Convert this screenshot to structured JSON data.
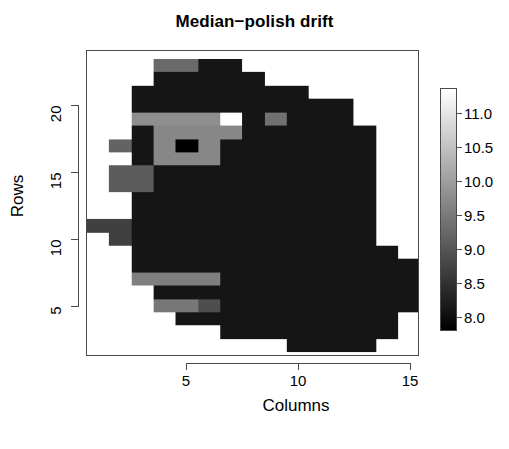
{
  "title": "Median−polish drift",
  "axes": {
    "x_label": "Columns",
    "y_label": "Rows",
    "x_ticks": [
      "5",
      "10",
      "15"
    ],
    "y_ticks": [
      "5",
      "10",
      "15",
      "20"
    ]
  },
  "colorbar": {
    "ticks": [
      "11.0",
      "10.5",
      "10.0",
      "9.5",
      "9.0",
      "8.5",
      "8.0"
    ],
    "low_color": "#000000",
    "high_color": "#ffffff"
  },
  "chart_data": {
    "type": "heatmap",
    "title": "Median−polish drift",
    "xlabel": "Columns",
    "ylabel": "Rows",
    "xlim": [
      0.5,
      15.4
    ],
    "ylim": [
      1.3,
      24.1
    ],
    "grid": false,
    "legend_position": "right",
    "colormap": "grayscale",
    "zlim": [
      7.7,
      11.3
    ],
    "colorbar_ticks": [
      8.0,
      8.5,
      9.0,
      9.5,
      10.0,
      10.5,
      11.0
    ],
    "x": [
      1,
      2,
      3,
      4,
      5,
      6,
      7,
      8,
      9,
      10,
      11,
      12,
      13,
      14,
      15
    ],
    "y": [
      2,
      3,
      4,
      5,
      6,
      7,
      8,
      9,
      10,
      11,
      12,
      13,
      14,
      15,
      16,
      17,
      18,
      19,
      20,
      21,
      22,
      23
    ],
    "z_note": "NA cells rendered white (no data); numeric cells are drift values in 7.7-11.3",
    "z": [
      [
        null,
        null,
        null,
        null,
        null,
        null,
        null,
        null,
        null,
        8.0,
        8.0,
        8.0,
        8.0,
        null,
        null
      ],
      [
        null,
        null,
        null,
        null,
        null,
        null,
        8.0,
        8.0,
        8.0,
        8.0,
        8.0,
        8.0,
        8.0,
        8.0,
        null
      ],
      [
        null,
        null,
        null,
        null,
        8.0,
        8.0,
        8.0,
        8.0,
        8.0,
        8.0,
        8.0,
        8.0,
        8.0,
        8.0,
        null
      ],
      [
        null,
        null,
        null,
        9.4,
        9.4,
        8.8,
        8.0,
        8.0,
        8.0,
        8.0,
        8.0,
        8.0,
        8.0,
        8.0,
        8.0
      ],
      [
        null,
        null,
        null,
        8.0,
        8.0,
        8.0,
        8.0,
        8.0,
        8.0,
        8.0,
        8.0,
        8.0,
        8.0,
        8.0,
        8.0
      ],
      [
        null,
        null,
        9.5,
        9.5,
        9.5,
        9.5,
        8.0,
        8.0,
        8.0,
        8.0,
        8.0,
        8.0,
        8.0,
        8.0,
        8.0
      ],
      [
        null,
        null,
        8.0,
        8.0,
        8.0,
        8.0,
        8.0,
        8.0,
        8.0,
        8.0,
        8.0,
        8.0,
        8.0,
        8.0,
        8.0
      ],
      [
        null,
        null,
        8.0,
        8.0,
        8.0,
        8.0,
        8.0,
        8.0,
        8.0,
        8.0,
        8.0,
        8.0,
        8.0,
        8.0,
        null
      ],
      [
        null,
        8.6,
        8.0,
        8.0,
        8.0,
        8.0,
        8.0,
        8.0,
        8.0,
        8.0,
        8.0,
        8.0,
        8.0,
        null,
        null
      ],
      [
        8.6,
        8.6,
        8.0,
        8.0,
        8.0,
        8.0,
        8.0,
        8.0,
        8.0,
        8.0,
        8.0,
        8.0,
        8.0,
        null,
        null
      ],
      [
        null,
        null,
        8.0,
        8.0,
        8.0,
        8.0,
        8.0,
        8.0,
        8.0,
        8.0,
        8.0,
        8.0,
        8.0,
        null,
        null
      ],
      [
        null,
        null,
        8.0,
        8.0,
        8.0,
        8.0,
        8.0,
        8.0,
        8.0,
        8.0,
        8.0,
        8.0,
        8.0,
        null,
        null
      ],
      [
        null,
        9.0,
        9.0,
        8.0,
        8.0,
        8.0,
        8.0,
        8.0,
        8.0,
        8.0,
        8.0,
        8.0,
        8.0,
        null,
        null
      ],
      [
        null,
        9.0,
        9.0,
        8.0,
        8.0,
        8.0,
        8.0,
        8.0,
        8.0,
        8.0,
        8.0,
        8.0,
        8.0,
        null,
        null
      ],
      [
        null,
        null,
        8.0,
        9.6,
        9.6,
        9.6,
        8.0,
        8.0,
        8.0,
        8.0,
        8.0,
        8.0,
        8.0,
        null,
        null
      ],
      [
        null,
        9.1,
        8.0,
        9.6,
        7.7,
        9.6,
        8.0,
        8.0,
        8.0,
        8.0,
        8.0,
        8.0,
        8.0,
        null,
        null
      ],
      [
        null,
        null,
        8.0,
        9.6,
        9.6,
        9.6,
        9.6,
        8.0,
        8.0,
        8.0,
        8.0,
        8.0,
        8.0,
        null,
        null
      ],
      [
        null,
        null,
        9.7,
        9.7,
        9.7,
        9.7,
        11.3,
        8.0,
        9.3,
        8.0,
        8.0,
        8.0,
        null,
        null,
        null
      ],
      [
        null,
        null,
        8.0,
        8.0,
        8.0,
        8.0,
        8.0,
        8.0,
        8.0,
        8.0,
        8.0,
        8.0,
        null,
        null,
        null
      ],
      [
        null,
        null,
        8.0,
        8.0,
        8.0,
        8.0,
        8.0,
        8.0,
        8.0,
        8.0,
        null,
        null,
        null,
        null,
        null
      ],
      [
        null,
        null,
        null,
        8.0,
        8.0,
        8.0,
        8.0,
        8.0,
        null,
        null,
        null,
        null,
        null,
        null,
        null
      ],
      [
        null,
        null,
        null,
        9.2,
        9.2,
        8.0,
        8.0,
        null,
        null,
        null,
        null,
        null,
        null,
        null,
        null
      ]
    ]
  }
}
